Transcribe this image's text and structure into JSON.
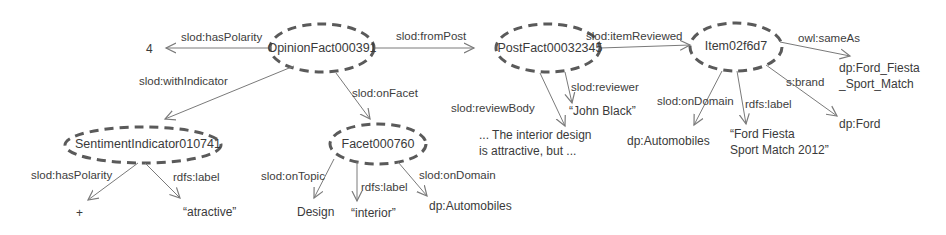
{
  "nodes": {
    "opinion_fact": "OpinionFact000391",
    "post_fact": "PostFact00032345",
    "item": "Item02f6d7",
    "sentiment_indicator": "SentimentIndicator010741",
    "facet": "Facet000760"
  },
  "literals": {
    "polarity_value": "4",
    "review_body_line1": "... The interior design",
    "review_body_line2": "is attractive, but ...",
    "reviewer": "“John Black”",
    "item_domain": "dp:Automobiles",
    "item_label_line1": "“Ford Fiesta",
    "item_label_line2": "Sport Match 2012”",
    "item_brand": "dp:Ford",
    "same_as_line1": "dp:Ford_Fiesta",
    "same_as_line2": "_Sport_Match",
    "indicator_polarity": "+",
    "indicator_label": "“atractive”",
    "facet_topic": "Design",
    "facet_label": "“interior”",
    "facet_domain": "dp:Automobiles"
  },
  "edges": {
    "has_polarity": "slod:hasPolarity",
    "from_post": "slod:fromPost",
    "with_indicator": "slod:withIndicator",
    "on_facet": "slod:onFacet",
    "item_reviewed": "slod:itemReviewed",
    "review_body": "slod:reviewBody",
    "reviewer": "slod:reviewer",
    "same_as": "owl:sameAs",
    "item_on_domain": "slod:onDomain",
    "item_rdfs_label": "rdfs:label",
    "brand": "s:brand",
    "indicator_has_polarity": "slod:hasPolarity",
    "indicator_rdfs_label": "rdfs:label",
    "facet_on_topic": "slod:onTopic",
    "facet_rdfs_label": "rdfs:label",
    "facet_on_domain": "slod:onDomain"
  },
  "colors": {
    "stroke": "#7a7a7a",
    "node_border": "#5a5a5a",
    "text": "#3a3a3a"
  }
}
